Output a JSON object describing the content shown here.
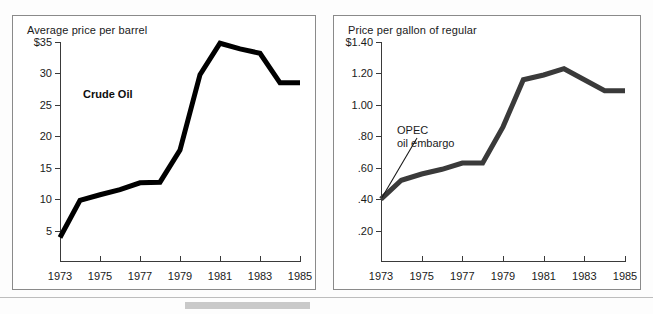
{
  "chart_data": [
    {
      "type": "line",
      "id": "crude-oil",
      "title": "Average price per barrel",
      "series_label": "Crude Oil",
      "xlabel": "",
      "ylabel": "Average price per barrel",
      "ylim": [
        0,
        35
      ],
      "xlim": [
        1973,
        1985
      ],
      "grid": false,
      "legend": "inline-label",
      "ytick_labels": [
        "$35",
        "30",
        "25",
        "20",
        "15",
        "10",
        "5"
      ],
      "ytick_values": [
        35,
        30,
        25,
        20,
        15,
        10,
        5
      ],
      "xtick_labels": [
        "1973",
        "1975",
        "1977",
        "1979",
        "1981",
        "1983",
        "1985"
      ],
      "xtick_values": [
        1973,
        1975,
        1977,
        1979,
        1981,
        1983,
        1985
      ],
      "x": [
        1973,
        1974,
        1975,
        1976,
        1977,
        1978,
        1979,
        1980,
        1981,
        1982,
        1983,
        1984,
        1985
      ],
      "values": [
        3.9,
        9.8,
        10.7,
        11.5,
        12.6,
        12.7,
        17.8,
        29.8,
        34.8,
        33.9,
        33.2,
        28.5,
        28.5
      ],
      "line_color": "#000000",
      "line_width_px": 5
    },
    {
      "type": "line",
      "id": "gasoline",
      "title": "Price per gallon of regular",
      "series_label": "Gasoline",
      "xlabel": "",
      "ylabel": "Price per gallon of regular",
      "ylim": [
        0,
        1.4
      ],
      "xlim": [
        1973,
        1985
      ],
      "grid": false,
      "legend": "inline-label",
      "ytick_labels": [
        "$1.40",
        "1.20",
        "1.00",
        ".80",
        ".60",
        ".40",
        ".20"
      ],
      "ytick_values": [
        1.4,
        1.2,
        1.0,
        0.8,
        0.6,
        0.4,
        0.2
      ],
      "xtick_labels": [
        "1973",
        "1975",
        "1977",
        "1979",
        "1981",
        "1983",
        "1985"
      ],
      "xtick_values": [
        1973,
        1975,
        1977,
        1979,
        1981,
        1983,
        1985
      ],
      "x": [
        1973,
        1974,
        1975,
        1976,
        1977,
        1978,
        1979,
        1980,
        1981,
        1982,
        1983,
        1984,
        1985
      ],
      "values": [
        0.4,
        0.52,
        0.56,
        0.59,
        0.63,
        0.63,
        0.86,
        1.16,
        1.19,
        1.23,
        1.16,
        1.09,
        1.09
      ],
      "line_color": "#3a3a3a",
      "line_width_px": 5,
      "annotations": [
        {
          "id": "opec-oil-embargo",
          "line1": "OPEC",
          "line2": "oil embargo",
          "points_to_x": 1973,
          "points_to_y": 0.41
        }
      ]
    }
  ],
  "panels": {
    "crude": {
      "caption": "Average price per barrel",
      "series_label": "Crude Oil"
    },
    "gasoline": {
      "caption": "Price per gallon of regular",
      "series_label": "Gasoline",
      "annotation_line1": "OPEC",
      "annotation_line2": "oil embargo"
    }
  },
  "colors": {
    "frame": "#8a8a8a",
    "axis": "#3a3a3a",
    "crude_line": "#000000",
    "gasoline_line": "#3a3a3a",
    "text": "#1a1a1a",
    "background": "#ffffff"
  }
}
